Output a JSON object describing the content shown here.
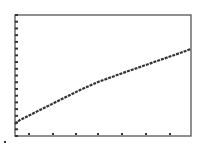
{
  "chart_data": {
    "type": "line",
    "title": "",
    "xlabel": "",
    "ylabel": "",
    "grid": false,
    "legend": "none",
    "frame": {
      "left": 15,
      "top": 15,
      "right": 191,
      "bottom": 136
    },
    "x_ticks_px": [
      29,
      53,
      76,
      98,
      122,
      146,
      170
    ],
    "y_tick_count": 18,
    "series": [
      {
        "name": "curve",
        "points_px": [
          [
            15,
            124
          ],
          [
            20,
            120
          ],
          [
            30,
            115
          ],
          [
            40,
            110
          ],
          [
            60,
            100
          ],
          [
            80,
            90
          ],
          [
            98,
            82
          ],
          [
            120,
            74
          ],
          [
            140,
            67
          ],
          [
            160,
            60
          ],
          [
            180,
            53
          ],
          [
            191,
            49
          ]
        ]
      }
    ],
    "shape": "concave-down increasing (power/sqrt-like)",
    "colors": {
      "line": "#333333",
      "frame": "#555555",
      "background": "#ffffff"
    }
  },
  "marker": {
    "x": 4,
    "y": 141
  }
}
